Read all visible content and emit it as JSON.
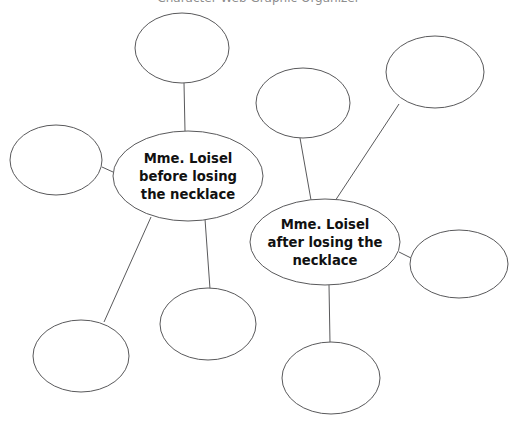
{
  "canvas": {
    "width": 517,
    "height": 424,
    "background": "#ffffff",
    "stroke_color": "#59595b",
    "stroke_width": 1,
    "text_color": "#111111"
  },
  "clipped_header": {
    "text": "Character Web Graphic Organizer",
    "note": "only descender pixels visible at very top edge"
  },
  "diagram": {
    "type": "double-bubble-web",
    "topic_nodes": [
      {
        "id": "node-before",
        "label": "Mme. Loisel before losing the necklace",
        "lines": [
          "Mme. Loisel",
          "before losing",
          "the necklace"
        ],
        "cx": 188,
        "cy": 176,
        "rx": 75,
        "ry": 45
      },
      {
        "id": "node-after",
        "label": "Mme. Loisel after losing the necklace",
        "lines": [
          "Mme. Loisel",
          "after losing the",
          "necklace"
        ],
        "cx": 325,
        "cy": 242,
        "rx": 75,
        "ry": 43
      }
    ],
    "detail_nodes": [
      {
        "id": "detail-top-left",
        "label": "",
        "cx": 182,
        "cy": 48,
        "rx": 47,
        "ry": 35
      },
      {
        "id": "detail-left",
        "label": "",
        "cx": 56,
        "cy": 160,
        "rx": 46,
        "ry": 35
      },
      {
        "id": "detail-bottom-left",
        "label": "",
        "cx": 81,
        "cy": 356,
        "rx": 48,
        "ry": 36
      },
      {
        "id": "detail-bottom-center",
        "label": "",
        "cx": 208,
        "cy": 324,
        "rx": 48,
        "ry": 36
      },
      {
        "id": "detail-top-center",
        "label": "",
        "cx": 303,
        "cy": 103,
        "rx": 47,
        "ry": 35
      },
      {
        "id": "detail-top-right",
        "label": "",
        "cx": 435,
        "cy": 72,
        "rx": 49,
        "ry": 36
      },
      {
        "id": "detail-right",
        "label": "",
        "cx": 459,
        "cy": 264,
        "rx": 49,
        "ry": 34
      },
      {
        "id": "detail-bottom-right",
        "label": "",
        "cx": 331,
        "cy": 378,
        "rx": 49,
        "ry": 36
      }
    ],
    "connectors": [
      {
        "id": "link-before-topleft",
        "from": "node-before",
        "to": "detail-top-left",
        "x1": 185,
        "y1": 131,
        "x2": 184,
        "y2": 83
      },
      {
        "id": "link-before-left",
        "from": "node-before",
        "to": "detail-left",
        "x1": 113,
        "y1": 172,
        "x2": 102,
        "y2": 167
      },
      {
        "id": "link-before-bottomleft",
        "from": "node-before",
        "to": "detail-bottom-left",
        "x1": 151,
        "y1": 217,
        "x2": 104,
        "y2": 322
      },
      {
        "id": "link-before-bottomcenter",
        "from": "node-before",
        "to": "detail-bottom-center",
        "x1": 205,
        "y1": 219,
        "x2": 210,
        "y2": 289
      },
      {
        "id": "link-after-topcenter",
        "from": "node-after",
        "to": "detail-top-center",
        "x1": 311,
        "y1": 200,
        "x2": 300,
        "y2": 138
      },
      {
        "id": "link-after-topright",
        "from": "node-after",
        "to": "detail-top-right",
        "x1": 335,
        "y1": 201,
        "x2": 399,
        "y2": 104
      },
      {
        "id": "link-after-right",
        "from": "node-after",
        "to": "detail-right",
        "x1": 399,
        "y1": 252,
        "x2": 411,
        "y2": 258
      },
      {
        "id": "link-after-bottomright",
        "from": "node-after",
        "to": "detail-bottom-right",
        "x1": 329,
        "y1": 285,
        "x2": 330,
        "y2": 343
      }
    ]
  }
}
